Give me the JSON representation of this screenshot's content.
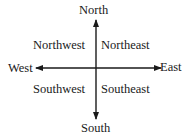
{
  "diagram": {
    "type": "compass-rose",
    "cardinal": {
      "north": "North",
      "south": "South",
      "east": "East",
      "west": "West"
    },
    "intercardinal": {
      "northwest": "Northwest",
      "northeast": "Northeast",
      "southwest": "Southwest",
      "southeast": "Southeast"
    },
    "colors": {
      "ink": "#1a1a1a",
      "background": "#ffffff"
    }
  }
}
